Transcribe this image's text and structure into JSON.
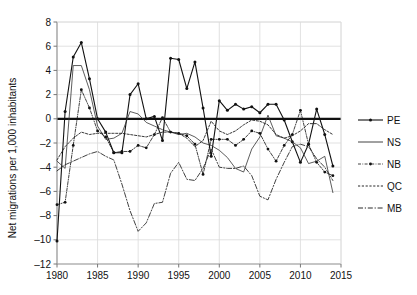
{
  "chart_data": {
    "type": "line",
    "title": "",
    "xlabel": "",
    "ylabel": "Net migrations per 1,000 inhabitants",
    "xlim": [
      1980,
      2015
    ],
    "ylim": [
      -12,
      8
    ],
    "xticks": [
      1980,
      1985,
      1990,
      1995,
      2000,
      2005,
      2010,
      2015
    ],
    "yticks": [
      8,
      6,
      4,
      2,
      0,
      -2,
      -4,
      -6,
      -8,
      -10,
      -12
    ],
    "grid": true,
    "zero_line": true,
    "legend_position": "right",
    "x": [
      1980,
      1981,
      1982,
      1983,
      1984,
      1985,
      1986,
      1987,
      1988,
      1989,
      1990,
      1991,
      1992,
      1993,
      1994,
      1995,
      1996,
      1997,
      1998,
      1999,
      2000,
      2001,
      2002,
      2003,
      2004,
      2005,
      2006,
      2007,
      2008,
      2009,
      2010,
      2011,
      2012,
      2013,
      2014
    ],
    "series": [
      {
        "name": "PE",
        "style": "solid-marker",
        "color": "#111111",
        "values": [
          -10.1,
          0.6,
          5.1,
          6.3,
          3.3,
          0.0,
          -1.1,
          -2.8,
          -2.8,
          2.0,
          2.9,
          0.0,
          0.2,
          -1.8,
          5.0,
          4.9,
          2.5,
          4.7,
          0.9,
          -3.1,
          1.5,
          0.7,
          1.2,
          0.8,
          1.0,
          0.5,
          1.2,
          1.2,
          -0.1,
          -1.9,
          -3.6,
          -2.1,
          0.8,
          -1.3,
          -3.9
        ]
      },
      {
        "name": "NS",
        "style": "thin-solid",
        "color": "#333333",
        "values": [
          -3.5,
          -4.1,
          4.4,
          4.4,
          2.4,
          -0.6,
          -1.7,
          -1.6,
          -1.2,
          0.6,
          0.4,
          -0.3,
          -0.6,
          -0.9,
          -1.1,
          -1.3,
          -1.2,
          -1.5,
          -2.0,
          -2.2,
          -2.6,
          -3.2,
          -4.1,
          -4.4,
          -2.5,
          -1.5,
          0.3,
          -1.4,
          -1.6,
          -1.9,
          -2.4,
          -3.7,
          -3.5,
          -3.1,
          -6.1
        ]
      },
      {
        "name": "NB",
        "style": "thin-dashdot-marker",
        "color": "#111111",
        "values": [
          -7.1,
          -6.9,
          -2.2,
          2.4,
          0.9,
          -1.0,
          -1.5,
          -2.8,
          -2.7,
          -2.7,
          -2.2,
          -2.4,
          -1.3,
          0.1,
          -1.1,
          -1.2,
          -1.4,
          -2.1,
          -4.6,
          -1.7,
          -1.7,
          -1.7,
          -2.2,
          -1.7,
          -1.0,
          -1.2,
          -2.5,
          -3.5,
          -2.2,
          -1.3,
          0.7,
          -2.1,
          -3.6,
          -4.4,
          -4.7
        ]
      },
      {
        "name": "QC",
        "style": "dotted",
        "color": "#222222",
        "values": [
          -3.4,
          -2.3,
          -1.6,
          -1.1,
          -1.3,
          -1.2,
          -1.2,
          -1.2,
          -1.2,
          -1.3,
          -1.4,
          -1.5,
          -1.3,
          -1.1,
          -1.1,
          -1.2,
          -1.6,
          -2.3,
          -1.8,
          -0.2,
          -1.0,
          -1.3,
          -1.0,
          -0.5,
          -0.1,
          -0.2,
          -0.5,
          -1.3,
          -1.6,
          -1.4,
          -1.0,
          -0.4,
          -0.4,
          -0.9,
          -1.3
        ]
      },
      {
        "name": "MB",
        "style": "dashdot",
        "color": "#2b2b2b",
        "values": [
          -4.3,
          -3.8,
          -3.5,
          -3.2,
          -2.9,
          -2.7,
          -3.1,
          -3.4,
          -5.4,
          -7.6,
          -9.3,
          -8.6,
          -7.0,
          -6.9,
          -4.5,
          -3.6,
          -5.0,
          -5.1,
          -4.1,
          -2.5,
          -4.0,
          -4.1,
          -4.1,
          -3.9,
          -4.7,
          -6.4,
          -6.7,
          -5.0,
          -3.6,
          -2.3,
          -2.1,
          -2.3,
          -3.3,
          -4.0,
          -5.1
        ]
      }
    ],
    "legend": [
      {
        "label": "PE",
        "style": "solid-marker"
      },
      {
        "label": "NS",
        "style": "thin-solid"
      },
      {
        "label": "NB",
        "style": "thin-dashdot-marker"
      },
      {
        "label": "QC",
        "style": "dotted"
      },
      {
        "label": "MB",
        "style": "dashdot"
      }
    ]
  }
}
